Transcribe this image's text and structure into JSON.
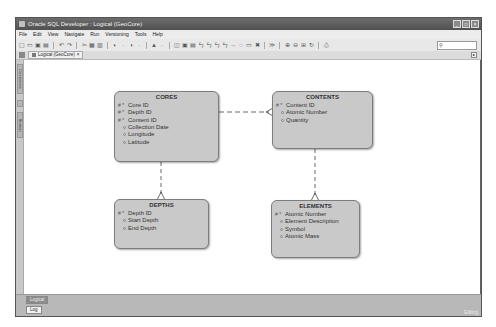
{
  "window": {
    "title": "Oracle SQL Developer : Logical (GeoCore)",
    "controls": [
      "minimize",
      "maximize",
      "close"
    ]
  },
  "menubar": {
    "items": [
      "File",
      "Edit",
      "View",
      "Navigate",
      "Run",
      "Versioning",
      "Tools",
      "Help"
    ]
  },
  "toolbar": {
    "icons": [
      "new-icon",
      "open-icon",
      "save-icon",
      "save-all-icon",
      "undo-icon",
      "redo-icon",
      "cut-icon",
      "copy-icon",
      "paste-icon",
      "back-icon",
      "forward-icon",
      "run-icon",
      "select-icon",
      "new-entity-icon",
      "new-view-icon",
      "new-relation-1-1-icon",
      "new-relation-1-n-icon",
      "new-relation-n-1-icon",
      "new-relation-m-n-icon",
      "arrow-icon",
      "note-icon",
      "delete-icon",
      "engineer-icon",
      "zoom-in-icon",
      "zoom-out-icon",
      "fit-icon",
      "refresh-icon",
      "print-icon"
    ],
    "search": {
      "value": "",
      "icon": "search-icon"
    }
  },
  "tabs": [
    {
      "label": "Logical (GeoCore)",
      "close": "×"
    }
  ],
  "side_tabs": [
    "Connections",
    "Browser"
  ],
  "diagram": {
    "entities": [
      {
        "name": "CORES",
        "attributes": [
          {
            "marker": "# *",
            "name": "Core ID"
          },
          {
            "marker": "# *",
            "name": "Depth ID"
          },
          {
            "marker": "# *",
            "name": "Content ID"
          },
          {
            "marker": "o",
            "name": "Collection Date"
          },
          {
            "marker": "o",
            "name": "Longitude"
          },
          {
            "marker": "o",
            "name": "Latitude"
          }
        ]
      },
      {
        "name": "CONTENTS",
        "attributes": [
          {
            "marker": "# *",
            "name": "Content ID"
          },
          {
            "marker": "o",
            "name": "Atomic Number"
          },
          {
            "marker": "o",
            "name": "Quantity"
          }
        ]
      },
      {
        "name": "DEPTHS",
        "attributes": [
          {
            "marker": "# *",
            "name": "Depth ID"
          },
          {
            "marker": "o",
            "name": "Start Depth"
          },
          {
            "marker": "o",
            "name": "End Depth"
          }
        ]
      },
      {
        "name": "ELEMENTS",
        "attributes": [
          {
            "marker": "# *",
            "name": "Atomic Number"
          },
          {
            "marker": "o",
            "name": "Element Description"
          },
          {
            "marker": "o",
            "name": "Symbol"
          },
          {
            "marker": "o",
            "name": "Atomic Mass"
          }
        ]
      }
    ],
    "relations": [
      {
        "from": "CORES",
        "to": "CONTENTS",
        "style": "dashed",
        "crowfoot_at": "CONTENTS"
      },
      {
        "from": "CORES",
        "to": "DEPTHS",
        "style": "dashed",
        "crowfoot_at": "DEPTHS"
      },
      {
        "from": "CONTENTS",
        "to": "ELEMENTS",
        "style": "dashed",
        "crowfoot_at": "ELEMENTS"
      }
    ]
  },
  "bottom": {
    "logical_tab": "Logical",
    "log_tab": "Log",
    "status": "Editing"
  }
}
